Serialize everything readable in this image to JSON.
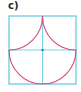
{
  "label": "c)",
  "figure": {
    "colors": {
      "square": "#5cc8e0",
      "axes": "#5cc8e0",
      "curve": "#d9467a",
      "center_point": "#2a8fb0"
    }
  }
}
